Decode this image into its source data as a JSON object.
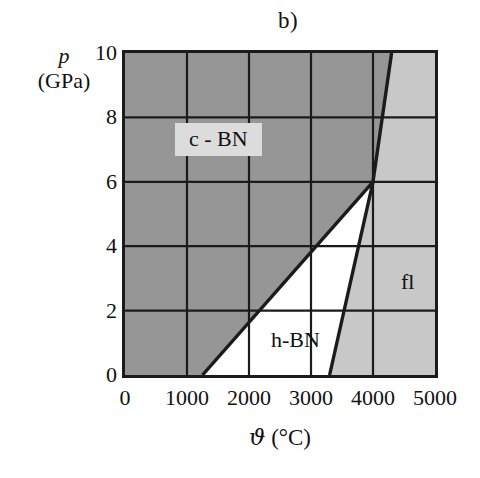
{
  "figure": {
    "panel_label": "b)",
    "colors": {
      "region_cbn": "#969696",
      "region_hbn": "#ffffff",
      "region_fl": "#c8c8c8",
      "axis": "#1b1b1b",
      "grid": "#1b1b1b",
      "label_box": "#dcdcdc",
      "background": "#ffffff"
    }
  },
  "axes": {
    "x": {
      "label_symbol": "ϑ",
      "label_unit": "(°C)",
      "ticks": [
        0,
        1000,
        2000,
        3000,
        4000,
        5000
      ],
      "tick_labels": [
        "0",
        "1000",
        "2000",
        "3000",
        "4000",
        "5000"
      ],
      "min": 0,
      "max": 5000
    },
    "y": {
      "label_symbol": "p",
      "label_unit": "(GPa)",
      "ticks": [
        0,
        2,
        4,
        6,
        8,
        10
      ],
      "tick_labels": [
        "0",
        "2",
        "4",
        "6",
        "8",
        "10"
      ],
      "min": 0,
      "max": 10
    }
  },
  "chart_data": {
    "type": "line",
    "title": "b)",
    "xlabel": "ϑ (°C)",
    "ylabel": "p (GPa)",
    "xlim": [
      0,
      5000
    ],
    "ylim": [
      0,
      10
    ],
    "grid": true,
    "legend": "none",
    "regions": [
      {
        "name": "c - BN",
        "fill": "#969696",
        "label_x": 1500,
        "label_y": 7.3,
        "polygon": [
          [
            0,
            0
          ],
          [
            1250,
            0
          ],
          [
            4000,
            6
          ],
          [
            4300,
            10
          ],
          [
            0,
            10
          ]
        ]
      },
      {
        "name": "h-BN",
        "fill": "#ffffff",
        "label_x": 2750,
        "label_y": 1.1,
        "polygon": [
          [
            1250,
            0
          ],
          [
            3300,
            0
          ],
          [
            4000,
            6
          ]
        ]
      },
      {
        "name": "fl",
        "fill": "#c8c8c8",
        "label_x": 4550,
        "label_y": 2.9,
        "polygon": [
          [
            3300,
            0
          ],
          [
            5000,
            0
          ],
          [
            5000,
            10
          ],
          [
            4300,
            10
          ],
          [
            4000,
            6
          ]
        ]
      }
    ],
    "boundaries": [
      {
        "name": "c-BN / h-BN",
        "points": [
          [
            1250,
            0
          ],
          [
            4000,
            6
          ]
        ]
      },
      {
        "name": "h-BN / fl",
        "points": [
          [
            3300,
            0
          ],
          [
            4000,
            6
          ]
        ]
      },
      {
        "name": "c-BN / fl",
        "points": [
          [
            4000,
            6
          ],
          [
            4300,
            10
          ]
        ]
      }
    ],
    "triple_point": {
      "x": 4000,
      "y": 6
    }
  },
  "region_labels": [
    {
      "id": "cbn",
      "text": "c - BN"
    },
    {
      "id": "hbn",
      "text": "h-BN"
    },
    {
      "id": "fl",
      "text": "fl"
    }
  ]
}
